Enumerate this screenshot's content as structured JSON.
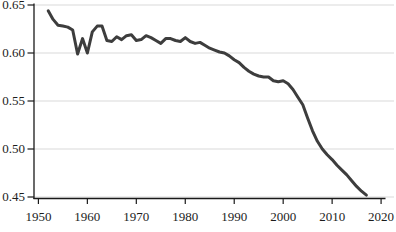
{
  "figure": {
    "background": "#ffffff"
  },
  "chart_data": {
    "type": "line",
    "title": "",
    "xlabel": "",
    "ylabel": "",
    "legend": "none",
    "grid": "horizontal",
    "xlim": [
      1949.1,
      2020.8
    ],
    "ylim": [
      0.45,
      0.65
    ],
    "x_ticks": [
      1950,
      1960,
      1970,
      1980,
      1990,
      2000,
      2010,
      2020
    ],
    "x_tick_labels": [
      "1950",
      "1960",
      "1970",
      "1980",
      "1990",
      "2000",
      "2010",
      "2020"
    ],
    "y_ticks": [
      0.45,
      0.5,
      0.55,
      0.6,
      0.65
    ],
    "y_tick_labels": [
      "0.45",
      "0.50",
      "0.55",
      "0.60",
      "0.65"
    ],
    "x": [
      1952,
      1953,
      1954,
      1955,
      1956,
      1957,
      1958,
      1959,
      1960,
      1961,
      1962,
      1963,
      1964,
      1965,
      1966,
      1967,
      1968,
      1969,
      1970,
      1971,
      1972,
      1973,
      1974,
      1975,
      1976,
      1977,
      1978,
      1979,
      1980,
      1981,
      1982,
      1983,
      1984,
      1985,
      1986,
      1987,
      1988,
      1989,
      1990,
      1991,
      1992,
      1993,
      1994,
      1995,
      1996,
      1997,
      1998,
      1999,
      2000,
      2001,
      2002,
      2003,
      2004,
      2005,
      2006,
      2007,
      2008,
      2009,
      2010,
      2011,
      2012,
      2013,
      2014,
      2015,
      2016,
      2017
    ],
    "values": [
      0.644,
      0.635,
      0.629,
      0.628,
      0.627,
      0.624,
      0.599,
      0.615,
      0.6,
      0.622,
      0.628,
      0.628,
      0.613,
      0.612,
      0.617,
      0.614,
      0.618,
      0.619,
      0.613,
      0.614,
      0.618,
      0.616,
      0.613,
      0.61,
      0.615,
      0.615,
      0.613,
      0.612,
      0.616,
      0.612,
      0.61,
      0.611,
      0.608,
      0.605,
      0.603,
      0.601,
      0.6,
      0.597,
      0.593,
      0.59,
      0.585,
      0.581,
      0.578,
      0.576,
      0.575,
      0.575,
      0.571,
      0.57,
      0.571,
      0.568,
      0.562,
      0.554,
      0.546,
      0.532,
      0.519,
      0.508,
      0.5,
      0.494,
      0.489,
      0.483,
      0.478,
      0.473,
      0.467,
      0.461,
      0.456,
      0.452
    ],
    "line_color": "#3d3d3d",
    "line_width": 3,
    "grid_color": "#d9d9d9",
    "axis_color": "#1a1a1a",
    "tick_label_color": "#1c1c1c"
  }
}
